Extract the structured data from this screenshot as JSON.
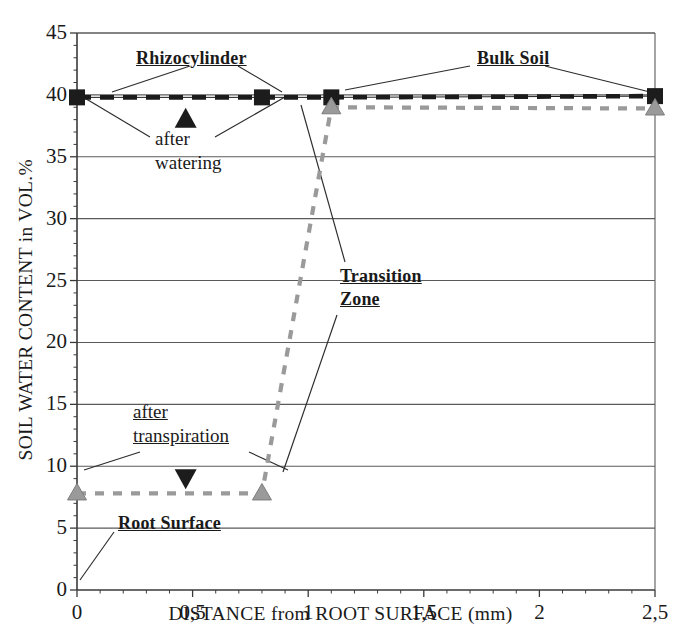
{
  "chart_data": {
    "type": "line",
    "title": "",
    "xlabel": "DISTANCE from ROOT SURFACE (mm)",
    "ylabel": "SOIL WATER CONTENT in VOL.%",
    "xlim": [
      0,
      2.5
    ],
    "ylim": [
      0,
      45
    ],
    "xticks": [
      "0",
      "0,5",
      "1",
      "1,5",
      "2",
      "2,5"
    ],
    "xtick_values": [
      0,
      0.5,
      1,
      1.5,
      2,
      2.5
    ],
    "yticks": [
      "0",
      "5",
      "10",
      "15",
      "20",
      "25",
      "30",
      "35",
      "40",
      "45"
    ],
    "ytick_values": [
      0,
      5,
      10,
      15,
      20,
      25,
      30,
      35,
      40,
      45
    ],
    "grid": "horizontal",
    "legend_position": "none",
    "minor_xticks_per_interval": 5,
    "minor_yticks_per_interval": 5,
    "series": [
      {
        "name": "after watering",
        "color": "#1c1c1c",
        "linestyle": "dashed",
        "marker": "square",
        "x": [
          0,
          0.8,
          1.1,
          2.5
        ],
        "values": [
          39.8,
          39.8,
          39.8,
          39.9
        ]
      },
      {
        "name": "after transpiration",
        "color": "#9a9a9a",
        "linestyle": "dashed",
        "marker": "triangle-up",
        "x": [
          0,
          0.8,
          1.1,
          2.5
        ],
        "values": [
          7.8,
          7.8,
          39.0,
          38.9
        ]
      }
    ],
    "annotations": [
      {
        "id": "rhizocylinder",
        "text": "Rhizocylinder",
        "style": "bold-underline",
        "x_px": 136,
        "y_px": 47,
        "leaders": [
          [
            190,
            66,
            112,
            92
          ],
          [
            238,
            66,
            282,
            92
          ]
        ]
      },
      {
        "id": "bulk-soil",
        "text": "Bulk Soil",
        "style": "bold-underline",
        "x_px": 477,
        "y_px": 47,
        "leaders": [
          [
            470,
            66,
            345,
            90
          ],
          [
            545,
            66,
            650,
            92
          ]
        ]
      },
      {
        "id": "after-watering",
        "text": "after watering",
        "style": "plain",
        "x_px": 155,
        "y_px": 127,
        "leaders": [
          [
            150,
            137,
            83,
            97
          ],
          [
            215,
            137,
            285,
            97
          ]
        ]
      },
      {
        "id": "after-transpiration",
        "text": "after transpiration",
        "style": "underline",
        "x_px": 133,
        "y_px": 400,
        "leaders": [
          [
            140,
            452,
            84,
            470
          ],
          [
            249,
            452,
            288,
            470
          ]
        ]
      },
      {
        "id": "transition-zone",
        "text": "Transition Zone",
        "style": "bold-underline",
        "x_px": 340,
        "y_px": 265,
        "leaders": [
          [
            345,
            262,
            301,
            105
          ],
          [
            337,
            315,
            283,
            472
          ]
        ]
      },
      {
        "id": "root-surface",
        "text": "Root Surface",
        "style": "bold-underline",
        "x_px": 118,
        "y_px": 512,
        "leaders": [
          [
            114,
            532,
            80,
            580
          ]
        ]
      }
    ],
    "direction_markers": [
      {
        "id": "up-triangle-watering",
        "shape": "triangle-up",
        "color": "#1c1c1c",
        "x": 0.47,
        "y": 38.0
      },
      {
        "id": "down-triangle-transpiration",
        "shape": "triangle-down",
        "color": "#1c1c1c",
        "x": 0.47,
        "y": 9.1
      }
    ]
  },
  "colors": {
    "axis": "#3a3a3a",
    "grid": "#5a5a5a",
    "watering_series": "#1c1c1c",
    "transpiration_series": "#9a9a9a",
    "background": "#ffffff"
  }
}
